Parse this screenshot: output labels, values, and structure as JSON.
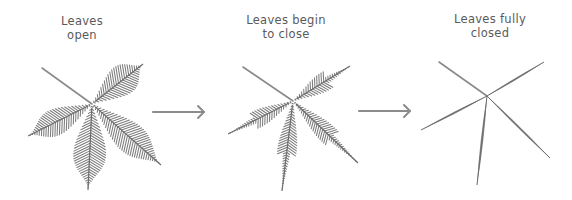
{
  "diagram": {
    "stages": [
      {
        "id": "open",
        "label_line1": "Leaves",
        "label_line2": "open",
        "label_pos": [
          82,
          14
        ],
        "center": [
          92,
          104
        ],
        "stem_start": [
          42,
          68
        ],
        "leaves": [
          {
            "tip": [
              143,
              64
            ],
            "width": 15,
            "closed": 0
          },
          {
            "tip": [
              28,
              136
            ],
            "width": 13,
            "closed": 0
          },
          {
            "tip": [
              88,
              190
            ],
            "width": 16,
            "closed": 0
          },
          {
            "tip": [
              161,
              165
            ],
            "width": 15,
            "closed": 0
          }
        ]
      },
      {
        "id": "begin",
        "label_line1": "Leaves begin",
        "label_line2": "to close",
        "label_pos": [
          286,
          13
        ],
        "center": [
          293,
          101
        ],
        "stem_start": [
          243,
          67
        ],
        "leaves": [
          {
            "tip": [
              350,
              66
            ],
            "width": 12,
            "closed": 0.45
          },
          {
            "tip": [
              228,
              134
            ],
            "width": 11,
            "closed": 0.45
          },
          {
            "tip": [
              282,
              191
            ],
            "width": 12,
            "closed": 0.45
          },
          {
            "tip": [
              358,
              163
            ],
            "width": 12,
            "closed": 0.45
          }
        ]
      },
      {
        "id": "closed",
        "label_line1": "Leaves fully",
        "label_line2": "closed",
        "label_pos": [
          490,
          12
        ],
        "center": [
          487,
          96
        ],
        "stem_start": [
          439,
          62
        ],
        "leaves": [
          {
            "tip": [
              544,
              62
            ],
            "width": 2,
            "closed": 1
          },
          {
            "tip": [
              421,
              130
            ],
            "width": 2,
            "closed": 1
          },
          {
            "tip": [
              477,
              185
            ],
            "width": 2.5,
            "closed": 1
          },
          {
            "tip": [
              550,
              158
            ],
            "width": 2,
            "closed": 1
          }
        ]
      }
    ],
    "arrows": [
      {
        "from": [
          153,
          112
        ],
        "to": [
          204,
          112
        ]
      },
      {
        "from": [
          359,
          111
        ],
        "to": [
          410,
          111
        ]
      }
    ],
    "colors": {
      "text": "#5a5a5a",
      "stem": "#8a8a8a",
      "leaf": "#6e6e6e",
      "arrow": "#8c8c8c"
    }
  }
}
